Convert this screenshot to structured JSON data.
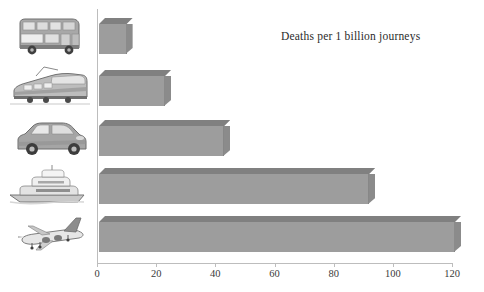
{
  "chart_data": {
    "type": "bar",
    "orientation": "horizontal",
    "title": "Deaths per 1 billion journeys",
    "xlabel": "",
    "ylabel": "",
    "categories": [
      "Bus",
      "Train",
      "Car",
      "Boat",
      "Plane"
    ],
    "values": [
      9,
      22,
      42,
      91,
      120
    ],
    "xlim": [
      0,
      120
    ],
    "xticks": [
      0,
      20,
      40,
      60,
      80,
      100,
      120
    ],
    "xtick_labels": [
      "0",
      "20",
      "40",
      "60",
      "80",
      "100",
      "120"
    ],
    "grid": false,
    "legend": null,
    "bar_style": "3d",
    "colors": {
      "bar_front": "#9d9d9d",
      "bar_top": "#808080",
      "bar_side": "#8b8b8b",
      "axis": "#bdbdbd",
      "text": "#2b2b2b"
    }
  },
  "axis": {
    "ticks": [
      {
        "label": "0",
        "value": 0
      },
      {
        "label": "20",
        "value": 20
      },
      {
        "label": "40",
        "value": 40
      },
      {
        "label": "60",
        "value": 60
      },
      {
        "label": "80",
        "value": 80
      },
      {
        "label": "100",
        "value": 100
      },
      {
        "label": "120",
        "value": 120
      }
    ]
  },
  "bars": [
    {
      "category": "Bus",
      "value": 9,
      "icon": "bus-image"
    },
    {
      "category": "Train",
      "value": 22,
      "icon": "train-image"
    },
    {
      "category": "Car",
      "value": 42,
      "icon": "car-image"
    },
    {
      "category": "Boat",
      "value": 91,
      "icon": "boat-image"
    },
    {
      "category": "Plane",
      "value": 120,
      "icon": "plane-image"
    }
  ]
}
